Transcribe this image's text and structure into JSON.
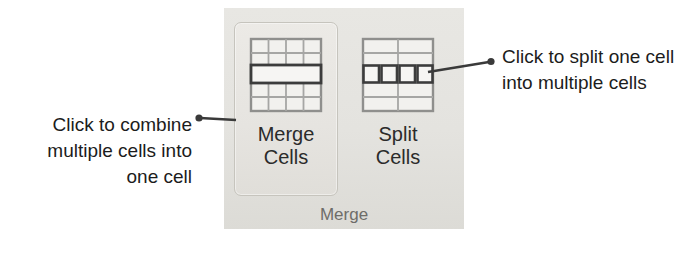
{
  "ribbon": {
    "group_label": "Merge",
    "background_color": "#e5e4e0",
    "buttons": [
      {
        "id": "merge-cells",
        "label_line1": "Merge",
        "label_line2": "Cells",
        "state": "highlighted",
        "icon": "merge-cells-table-icon",
        "icon_description": "table with four columns whose middle row is merged into one wide cell"
      },
      {
        "id": "split-cells",
        "label_line1": "Split",
        "label_line2": "Cells",
        "state": "normal",
        "icon": "split-cells-table-icon",
        "icon_description": "table with two columns whose middle row is split into four small cells"
      }
    ]
  },
  "annotations": {
    "left": {
      "name": "merge-cells-callout",
      "text": "Click to combine\nmultiple cells into\none cell",
      "line_color": "#3a3a3a",
      "dot_color": "#3a3a3a"
    },
    "right": {
      "name": "split-cells-callout",
      "text": "Click to split one cell\ninto multiple cells",
      "line_color": "#3a3a3a",
      "dot_color": "#3a3a3a"
    }
  },
  "colors": {
    "text": "#1c1c1c",
    "group_label_text": "#6e6d69",
    "button_border": "#c6c4bd",
    "icon_line_dark": "#4a4a4a",
    "icon_line_light": "#9a9a9a",
    "icon_cell_fill": "#f2f1ee"
  }
}
